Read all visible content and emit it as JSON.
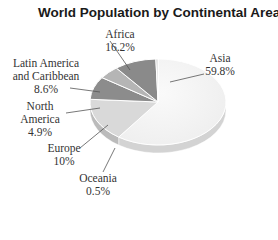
{
  "chart_data": {
    "type": "pie",
    "title": "World Population by Continental Area",
    "categories": [
      "Asia",
      "Africa",
      "Latin America and Caribbean",
      "North America",
      "Europe",
      "Oceania"
    ],
    "values": [
      59.8,
      16.2,
      8.6,
      4.9,
      10,
      0.5
    ],
    "value_labels": [
      "59.8%",
      "16.2%",
      "8.6%",
      "4.9%",
      "10%",
      "0.5%"
    ],
    "colors": [
      "#f1f1f1",
      "#d9d9d9",
      "#8c8c8c",
      "#b5b5b5",
      "#8a8a8a",
      "#cfcfcf"
    ],
    "style": "3d",
    "legend": "none (callout labels)"
  },
  "labels": {
    "africa": {
      "name": "Africa",
      "value": "16.2%"
    },
    "latin_a": {
      "name": "Latin America",
      "name2": "and Caribbean",
      "value": "8.6%"
    },
    "north": {
      "name": "North",
      "name2": "America",
      "value": "4.9%"
    },
    "europe": {
      "name": "Europe",
      "value": "10%"
    },
    "oceania": {
      "name": "Oceania",
      "value": "0.5%"
    },
    "asia": {
      "name": "Asia",
      "value": "59.8%"
    }
  }
}
